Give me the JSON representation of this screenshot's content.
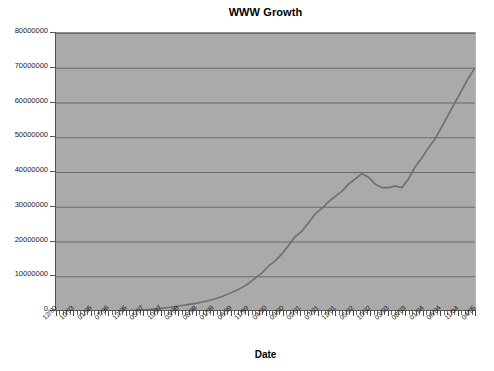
{
  "chart_data": {
    "type": "line",
    "title": "WWW Growth",
    "xlabel": "Date",
    "ylabel": "",
    "ylim": [
      0,
      80000000
    ],
    "y_ticks": [
      0,
      10000000,
      20000000,
      30000000,
      40000000,
      50000000,
      60000000,
      70000000,
      80000000
    ],
    "y_tick_labels": [
      "0",
      "10000000",
      "20000000",
      "30000000",
      "40000000",
      "50000000",
      "60000000",
      "70000000",
      "80000000"
    ],
    "grid": true,
    "legend": null,
    "x_tick_labels": [
      "12/90",
      "10/93",
      "01/96",
      "07/96",
      "12/96",
      "05/97",
      "10/97",
      "03/98",
      "08/98",
      "01/99",
      "06/99",
      "11/99",
      "04/00",
      "09/00",
      "02/01",
      "07/01",
      "12/01",
      "05/02",
      "10/02",
      "03/03",
      "08/03",
      "01/04",
      "06/04",
      "11/04",
      "04/05"
    ],
    "series": [
      {
        "name": "WWW Sites",
        "x": [
          "12/90",
          "06/91",
          "12/91",
          "06/92",
          "12/92",
          "06/93",
          "10/93",
          "12/93",
          "03/94",
          "06/94",
          "09/94",
          "12/94",
          "03/95",
          "06/95",
          "09/95",
          "01/96",
          "04/96",
          "07/96",
          "10/96",
          "12/96",
          "02/97",
          "05/97",
          "08/97",
          "10/97",
          "12/97",
          "03/98",
          "06/98",
          "08/98",
          "10/98",
          "01/99",
          "03/99",
          "06/99",
          "09/99",
          "11/99",
          "01/00",
          "04/00",
          "07/00",
          "09/00",
          "11/00",
          "02/01",
          "04/01",
          "07/01",
          "09/01",
          "11/01",
          "12/01",
          "02/02",
          "05/02",
          "07/02",
          "09/02",
          "10/02",
          "12/02",
          "01/03",
          "03/03",
          "05/03",
          "08/03",
          "10/03",
          "01/04",
          "03/04",
          "06/04",
          "09/04",
          "11/04",
          "01/05",
          "04/05",
          "06/05"
        ],
        "values": [
          1,
          5,
          20,
          80,
          300,
          800,
          1500,
          2700,
          11000,
          23000,
          40000,
          100000,
          180000,
          300000,
          450000,
          600000,
          800000,
          1000000,
          1300000,
          1600000,
          1900000,
          2200000,
          2600000,
          3000000,
          3500000,
          4200000,
          5000000,
          5800000,
          6800000,
          8000000,
          9500000,
          11000000,
          13000000,
          14500000,
          16500000,
          19000000,
          21500000,
          23000000,
          25500000,
          28000000,
          29500000,
          31500000,
          33000000,
          34500000,
          36500000,
          38000000,
          39500000,
          38500000,
          36500000,
          35500000,
          35500000,
          36000000,
          35500000,
          38000000,
          41500000,
          44000000,
          47000000,
          49500000,
          53000000,
          56500000,
          60000000,
          63500000,
          67000000,
          70000000
        ],
        "color": "#6e6e6e"
      }
    ],
    "plot_background": "#aaaaaa",
    "gridline_color": "#6b6b6b",
    "axis_color": "#555555",
    "start_value": 0,
    "end_value": 70000000
  }
}
